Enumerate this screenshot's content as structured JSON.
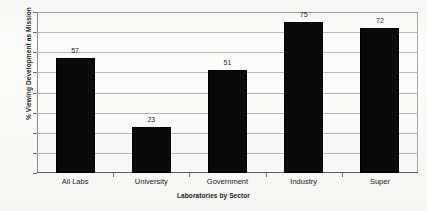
{
  "chart_data": {
    "type": "bar",
    "title": "",
    "subtitle": "",
    "categories": [
      "All Labs",
      "University",
      "Government",
      "Industry",
      "Super"
    ],
    "values": [
      57,
      23,
      51,
      75,
      72
    ],
    "value_labels": [
      "57",
      "23",
      "51",
      "75",
      "72"
    ],
    "xlabel": "Laboratories by Sector",
    "ylabel": "% Viewing Development as Mission",
    "ylim": [
      0,
      80
    ],
    "ytick_step": 10,
    "ytick_labels": [
      "80",
      "70",
      "60",
      "50",
      "40",
      "30",
      "20",
      "10",
      "0"
    ],
    "ytick_values": [
      80,
      70,
      60,
      50,
      40,
      30,
      20,
      10,
      0
    ],
    "grid": "horizontal",
    "legend": "none",
    "bar_color": "#0a0a0a",
    "grid_color": "#b4b4b4",
    "axis_color": "#5d5d5d",
    "background_color": "#fbfbfa"
  }
}
